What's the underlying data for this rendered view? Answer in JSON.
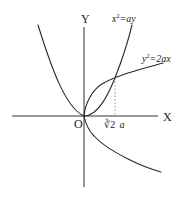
{
  "diagram": {
    "axes": {
      "x_label": "X",
      "y_label": "Y",
      "origin_label": "O"
    },
    "curves": [
      {
        "name": "parabola-x2-ay",
        "equation_base": "x",
        "equation_sup": "2",
        "equation_rest": "=ay"
      },
      {
        "name": "parabola-y2-2ax",
        "equation_base": "y",
        "equation_sup": "2",
        "equation_rest": "=2ax"
      }
    ],
    "intersection": {
      "tick_radical": "∛2",
      "tick_var": "a"
    }
  }
}
